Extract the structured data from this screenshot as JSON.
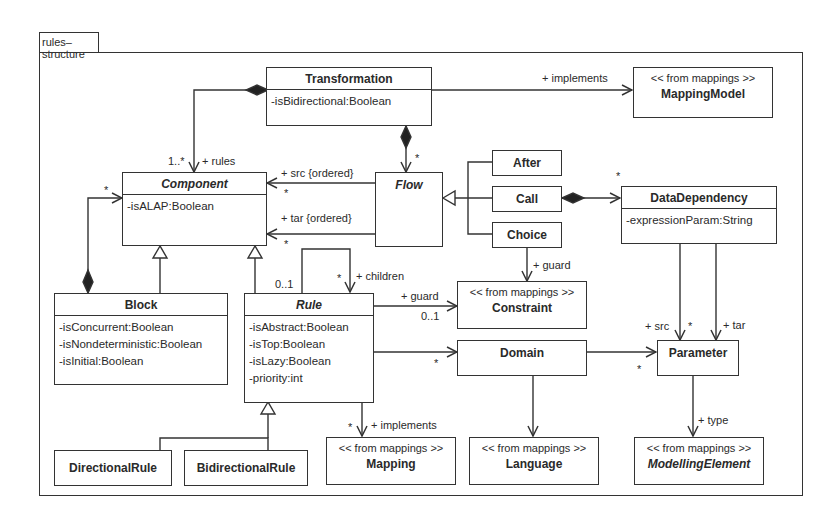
{
  "package": {
    "name": "rules–structure"
  },
  "classes": {
    "transformation": {
      "name": "Transformation",
      "attrs": [
        "-isBidirectional:Boolean"
      ]
    },
    "mappingModel": {
      "stereotype": "<< from mappings >>",
      "name": "MappingModel"
    },
    "component": {
      "name": "Component",
      "abstract": true,
      "attrs": [
        "-isALAP:Boolean"
      ]
    },
    "flow": {
      "name": "Flow",
      "abstract": true
    },
    "after": {
      "name": "After"
    },
    "call": {
      "name": "Call"
    },
    "choice": {
      "name": "Choice"
    },
    "dataDependency": {
      "name": "DataDependency",
      "attrs": [
        "-expressionParam:String"
      ]
    },
    "block": {
      "name": "Block",
      "attrs": [
        "-isConcurrent:Boolean",
        "-isNondeterministic:Boolean",
        "-isInitial:Boolean"
      ]
    },
    "rule": {
      "name": "Rule",
      "abstract": true,
      "attrs": [
        "-isAbstract:Boolean",
        "-isTop:Boolean",
        "-isLazy:Boolean",
        "-priority:int"
      ]
    },
    "constraint": {
      "stereotype": "<< from mappings >>",
      "name": "Constraint"
    },
    "domain": {
      "name": "Domain"
    },
    "parameter": {
      "name": "Parameter"
    },
    "directionalRule": {
      "name": "DirectionalRule"
    },
    "bidirectionalRule": {
      "name": "BidirectionalRule"
    },
    "mapping": {
      "stereotype": "<< from mappings >>",
      "name": "Mapping"
    },
    "language": {
      "stereotype": "<< from mappings >>",
      "name": "Language"
    },
    "modellingElement": {
      "stereotype": "<< from mappings >>",
      "name": "ModellingElement",
      "abstract": true
    }
  },
  "labels": {
    "implements_top": "+ implements",
    "rules_mult": "1..*",
    "rules_role": "+ rules",
    "flow_mult": "*",
    "src_role": "+ src {ordered}",
    "src_mult": "*",
    "tar_role": "+ tar {ordered}",
    "tar_mult": "*",
    "block_comp_mult": "*",
    "children_parent_mult": "0..1",
    "children_mult": "*",
    "children_role": "+ children",
    "guard_rule_role": "+ guard",
    "guard_rule_mult": "0..1",
    "guard_choice_role": "+ guard",
    "datadep_mult": "*",
    "domain_mult": "*",
    "param_mult": "*",
    "pd_src_role": "+ src",
    "pd_src_mult": "*",
    "pd_tar_role": "+ tar",
    "mapping_mult": "*",
    "implements_mapping": "+ implements",
    "type_role": "+ type"
  }
}
